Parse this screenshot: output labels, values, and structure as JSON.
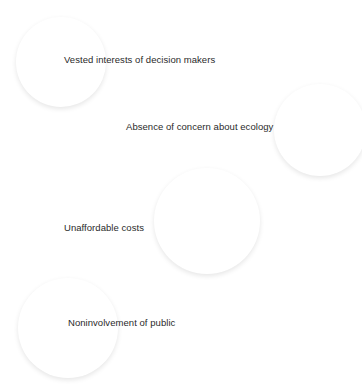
{
  "diagram": {
    "background_color": "#ffffff",
    "shape_type": "sphere",
    "label_color": "#2a2a2a",
    "nodes": [
      {
        "id": "vested-interests",
        "label": "Vested interests of decision makers",
        "fill_color": "#cdcdcd",
        "x": 20,
        "y": 21,
        "size": 82,
        "label_x": 64,
        "label_y": 54
      },
      {
        "id": "absence-of-concern",
        "label": "Absence of concern about ecology",
        "fill_color": "#dedede",
        "x": 278,
        "y": 88,
        "size": 84,
        "label_x": 126,
        "label_y": 121
      },
      {
        "id": "unaffordable-costs",
        "label": "Unaffordable costs",
        "fill_color": "#eaeaea",
        "x": 158,
        "y": 172,
        "size": 98,
        "label_x": 64,
        "label_y": 222
      },
      {
        "id": "noninvolvement-of-public",
        "label": "Noninvolvement of public",
        "fill_color": "#cdcdcd",
        "x": 22,
        "y": 282,
        "size": 92,
        "label_x": 68,
        "label_y": 317
      }
    ]
  }
}
